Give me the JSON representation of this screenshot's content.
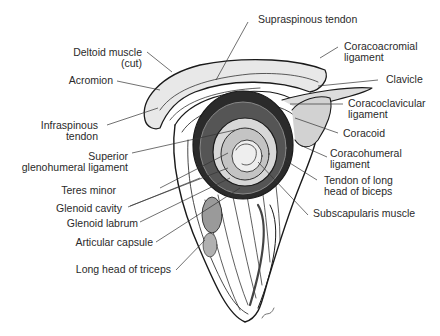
{
  "figure": {
    "colors": {
      "ink": "#1a1a1a",
      "label": "#2a2a2a",
      "background": "#ffffff"
    }
  },
  "labels": {
    "supraspinous_tendon": "Supraspinous tendon",
    "deltoid_muscle_1": "Deltoid muscle",
    "deltoid_muscle_2": "(cut)",
    "coracoacromial_1": "Coracoacromial",
    "coracoacromial_2": "ligament",
    "acromion": "Acromion",
    "clavicle": "Clavicle",
    "infraspinous_1": "Infraspinous",
    "infraspinous_2": "tendon",
    "coracoclavicular_1": "Coracoclavicular",
    "coracoclavicular_2": "ligament",
    "coracoid": "Coracoid",
    "superior_gh_1": "Superior",
    "superior_gh_2": "glenohumeral ligament",
    "coracohumeral_1": "Coracohumeral",
    "coracohumeral_2": "ligament",
    "teres_minor": "Teres minor",
    "biceps_tendon_1": "Tendon of long",
    "biceps_tendon_2": "head of biceps",
    "glenoid_cavity": "Glenoid cavity",
    "subscapularis": "Subscapularis muscle",
    "glenoid_labrum": "Glenoid labrum",
    "articular_capsule": "Articular capsule",
    "triceps_long_head": "Long head of triceps"
  }
}
